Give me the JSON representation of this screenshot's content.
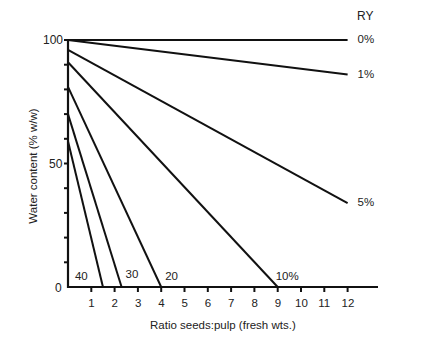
{
  "chart_data": {
    "type": "line",
    "title": "",
    "xlabel": "Ratio seeds:pulp (fresh wts.)",
    "ylabel": "Water content (% w/w)",
    "xlim": [
      0,
      12.5
    ],
    "ylim": [
      0,
      100
    ],
    "x_ticks": [
      1,
      2,
      3,
      4,
      5,
      6,
      7,
      8,
      9,
      10,
      11,
      12
    ],
    "y_tick_labels": [
      0,
      50,
      100
    ],
    "y_minor_ticks_every": 10,
    "grid": false,
    "legend_title": "RY",
    "series": [
      {
        "name": "0%",
        "x": [
          0,
          12
        ],
        "y": [
          100,
          100
        ],
        "label_pos": "right-end"
      },
      {
        "name": "1%",
        "x": [
          0,
          12
        ],
        "y": [
          100,
          86
        ],
        "label_pos": "right-end"
      },
      {
        "name": "5%",
        "x": [
          0,
          12
        ],
        "y": [
          96,
          34
        ],
        "label_pos": "right-end"
      },
      {
        "name": "10%",
        "x": [
          0,
          9
        ],
        "y": [
          91,
          0
        ],
        "label_pos": "x-intercept"
      },
      {
        "name": "20",
        "x": [
          0,
          4
        ],
        "y": [
          81,
          0
        ],
        "label_pos": "x-intercept"
      },
      {
        "name": "30",
        "x": [
          0,
          2.3
        ],
        "y": [
          70,
          0
        ],
        "label_pos": "x-intercept"
      },
      {
        "name": "40",
        "x": [
          0,
          1.5
        ],
        "y": [
          59,
          0
        ],
        "label_pos": "x-intercept"
      }
    ]
  },
  "labels": {
    "legend_title": "RY",
    "xlabel": "Ratio seeds:pulp (fresh wts.)",
    "ylabel": "Water content (% w/w)",
    "y100": "100",
    "y50": "50",
    "y0": "0"
  }
}
